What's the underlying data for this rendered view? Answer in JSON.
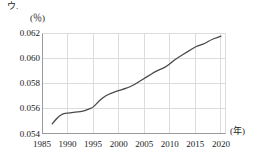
{
  "labels": {
    "item_marker": "ウ.",
    "y_unit": "(％)",
    "x_unit": "(年)"
  },
  "chart_data": {
    "type": "line",
    "title": "",
    "xlabel": "(年)",
    "ylabel": "(％)",
    "xlim": [
      1985,
      2021
    ],
    "ylim": [
      0.054,
      0.062
    ],
    "xticks": [
      1985,
      1990,
      1995,
      2000,
      2005,
      2010,
      2015,
      2020
    ],
    "xtick_labels": [
      "1985",
      "1990",
      "1995",
      "2000",
      "2005",
      "2010",
      "2015",
      "2020"
    ],
    "yticks": [
      0.054,
      0.056,
      0.058,
      0.06,
      0.062
    ],
    "ytick_labels": [
      "0.054",
      "0.056",
      "0.058",
      "0.060",
      "0.062"
    ],
    "grid": true,
    "legend": "none",
    "line_color": "#4a4a4a",
    "grid_color": "#dcdcdc",
    "axis_color": "#9a9a9a",
    "x": [
      1987,
      1988,
      1989,
      1990,
      1991,
      1992,
      1993,
      1994,
      1995,
      1996,
      1997,
      1998,
      1999,
      2000,
      2001,
      2002,
      2003,
      2004,
      2005,
      2006,
      2007,
      2008,
      2009,
      2010,
      2011,
      2012,
      2013,
      2014,
      2015,
      2016,
      2017,
      2018,
      2019,
      2020
    ],
    "values": [
      0.0548,
      0.0553,
      0.0556,
      0.05565,
      0.0557,
      0.05575,
      0.0558,
      0.05595,
      0.0561,
      0.05655,
      0.0569,
      0.05715,
      0.0573,
      0.05745,
      0.05755,
      0.0577,
      0.0579,
      0.05815,
      0.0584,
      0.05865,
      0.0589,
      0.0591,
      0.05925,
      0.05955,
      0.0599,
      0.06015,
      0.0604,
      0.06065,
      0.0609,
      0.06105,
      0.0612,
      0.06145,
      0.0616,
      0.06175
    ]
  }
}
